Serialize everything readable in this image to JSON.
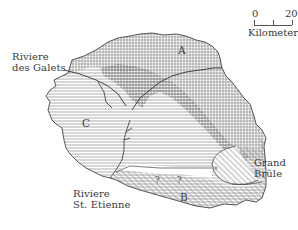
{
  "map": {
    "subject": "Volcanic island geologic map",
    "zones": [
      {
        "id": "A",
        "label": "A",
        "pattern": "vertical-lines"
      },
      {
        "id": "B",
        "label": "B",
        "pattern": "diagonal-lines"
      },
      {
        "id": "C",
        "label": "C",
        "pattern": "horizontal-lines"
      },
      {
        "id": "stipple",
        "label": "",
        "pattern": "stippled"
      }
    ],
    "place_labels": {
      "galets_line1": "Riviere",
      "galets_line2": "des Galets",
      "etienne_line1": "Riviere",
      "etienne_line2": "St. Etienne",
      "brule_line1": "Grand",
      "brule_line2": "Brûle"
    },
    "uncertain_markers": [
      "?",
      "?"
    ],
    "scale_bar": {
      "start": "0",
      "end": "20",
      "unit": "Kilometers"
    },
    "colors": {
      "ink": "#3a3a3a",
      "hatch": "#8a8a8a",
      "background": "#ffffff"
    }
  }
}
